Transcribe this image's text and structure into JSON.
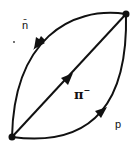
{
  "diagram": {
    "type": "feynman-loop",
    "vertices": [
      {
        "id": "top-right",
        "x": 126,
        "y": 14
      },
      {
        "id": "bottom-left",
        "x": 12,
        "y": 137
      }
    ],
    "lines": [
      {
        "id": "antineutron",
        "label": "n̄",
        "path": "upper-left arc",
        "arrow_direction": "top-right to bottom-left"
      },
      {
        "id": "pion",
        "label": "π",
        "label_sup": "−",
        "path": "diagonal",
        "arrow_direction": "bottom-left to top-right"
      },
      {
        "id": "proton",
        "label": "p",
        "path": "lower-right arc",
        "arrow_direction": "bottom-left to top-right"
      }
    ],
    "colors": {
      "line": "#111111",
      "background": "#ffffff"
    }
  }
}
